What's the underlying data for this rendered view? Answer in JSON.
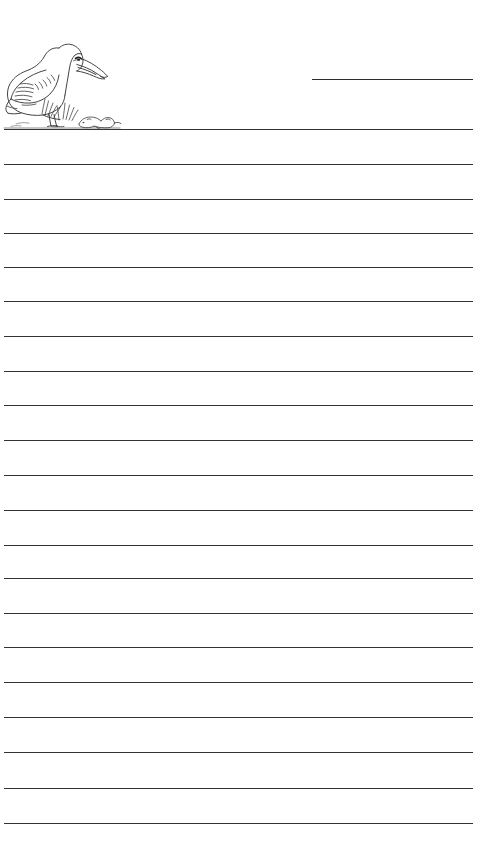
{
  "page": {
    "kind": "lined-writing-paper",
    "width": 499,
    "height": 863,
    "background_color": "#ffffff",
    "line_color": "#333333",
    "ink_color": "#2d2d2d"
  },
  "header": {
    "illustration": {
      "name": "pelican-illustration",
      "subject": "pelican standing on ground with grass tufts and a small mouse",
      "style": "black-and-white line drawing",
      "stroke_color": "#3a3a3a",
      "fill_color": "#ffffff",
      "left": 2,
      "top": 18,
      "width": 128,
      "height": 112
    },
    "name_blank": {
      "label": "",
      "placeholder": "",
      "value": "",
      "left": 312,
      "top": 79,
      "width": 161
    }
  },
  "ruled_area": {
    "first_line_y": 129,
    "line_spacing": 34.7,
    "line_count": 21,
    "line_left": 4,
    "line_right": 473,
    "line_width": 469,
    "line_thickness": 1.7,
    "lines": [
      {
        "index": 1,
        "y": 129,
        "value": ""
      },
      {
        "index": 2,
        "y": 164,
        "value": ""
      },
      {
        "index": 3,
        "y": 199,
        "value": ""
      },
      {
        "index": 4,
        "y": 233,
        "value": ""
      },
      {
        "index": 5,
        "y": 267,
        "value": ""
      },
      {
        "index": 6,
        "y": 301,
        "value": ""
      },
      {
        "index": 7,
        "y": 336,
        "value": ""
      },
      {
        "index": 8,
        "y": 371,
        "value": ""
      },
      {
        "index": 9,
        "y": 405,
        "value": ""
      },
      {
        "index": 10,
        "y": 440,
        "value": ""
      },
      {
        "index": 11,
        "y": 475,
        "value": ""
      },
      {
        "index": 12,
        "y": 510,
        "value": ""
      },
      {
        "index": 13,
        "y": 545,
        "value": ""
      },
      {
        "index": 14,
        "y": 578,
        "value": ""
      },
      {
        "index": 15,
        "y": 613,
        "value": ""
      },
      {
        "index": 16,
        "y": 647,
        "value": ""
      },
      {
        "index": 17,
        "y": 682,
        "value": ""
      },
      {
        "index": 18,
        "y": 717,
        "value": ""
      },
      {
        "index": 19,
        "y": 752,
        "value": ""
      },
      {
        "index": 20,
        "y": 788,
        "value": ""
      },
      {
        "index": 21,
        "y": 823,
        "value": ""
      }
    ]
  }
}
